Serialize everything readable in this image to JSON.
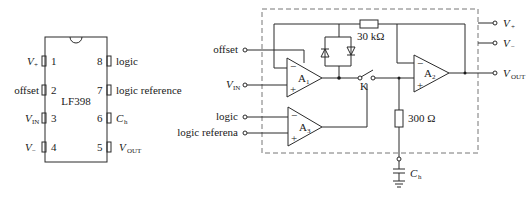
{
  "chip": {
    "name": "LF398",
    "pins": [
      {
        "num": "1",
        "label": "V",
        "sub": "+",
        "side": "left"
      },
      {
        "num": "2",
        "label": "offset",
        "sub": "",
        "side": "left"
      },
      {
        "num": "3",
        "label": "V",
        "sub": "IN",
        "side": "left"
      },
      {
        "num": "4",
        "label": "V",
        "sub": "−",
        "side": "left"
      },
      {
        "num": "8",
        "label": "logic",
        "sub": "",
        "side": "right"
      },
      {
        "num": "7",
        "label": "logic reference",
        "sub": "",
        "side": "right"
      },
      {
        "num": "6",
        "label": "C",
        "sub": "h",
        "side": "right"
      },
      {
        "num": "5",
        "label": "V",
        "sub": "OUT",
        "side": "right"
      }
    ]
  },
  "schematic": {
    "inputs": {
      "offset": "offset",
      "vin": "V",
      "vin_sub": "IN",
      "logic": "logic",
      "logic_ref": "logic referena"
    },
    "amps": {
      "a1": "A",
      "a1_sub": "1",
      "a2": "A",
      "a2_sub": "2",
      "a3": "A",
      "a3_sub": "3"
    },
    "resistors": {
      "r_feedback": "30 kΩ",
      "r_hold": "300 Ω"
    },
    "switch_label": "K",
    "capacitor": {
      "label": "C",
      "sub": "h"
    },
    "outputs": {
      "vplus": "V",
      "vplus_sub": "+",
      "vminus": "V",
      "vminus_sub": "−",
      "vout": "V",
      "vout_sub": "OUT"
    },
    "amp_signs": {
      "minus": "−",
      "plus": "+"
    }
  }
}
